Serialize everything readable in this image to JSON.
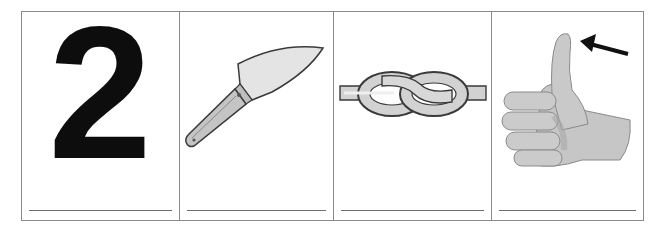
{
  "worksheet": {
    "title": "",
    "panels": [
      {
        "id": "panel-1",
        "content_type": "digit",
        "glyph": "2",
        "depicts": "number two",
        "answer": ""
      },
      {
        "id": "panel-2",
        "content_type": "illustration",
        "depicts": "knife",
        "answer": ""
      },
      {
        "id": "panel-3",
        "content_type": "illustration",
        "depicts": "knot",
        "answer": ""
      },
      {
        "id": "panel-4",
        "content_type": "illustration",
        "depicts": "thumb (thumbs-up hand with arrow pointing to thumb tip)",
        "answer": ""
      }
    ]
  },
  "colors": {
    "border": "#8a8a8a",
    "answer_line": "#6e6e6e",
    "digit": "#0d0d0d",
    "illustration_fill": "#c9c9c9",
    "illustration_stroke": "#3a3a3a"
  }
}
